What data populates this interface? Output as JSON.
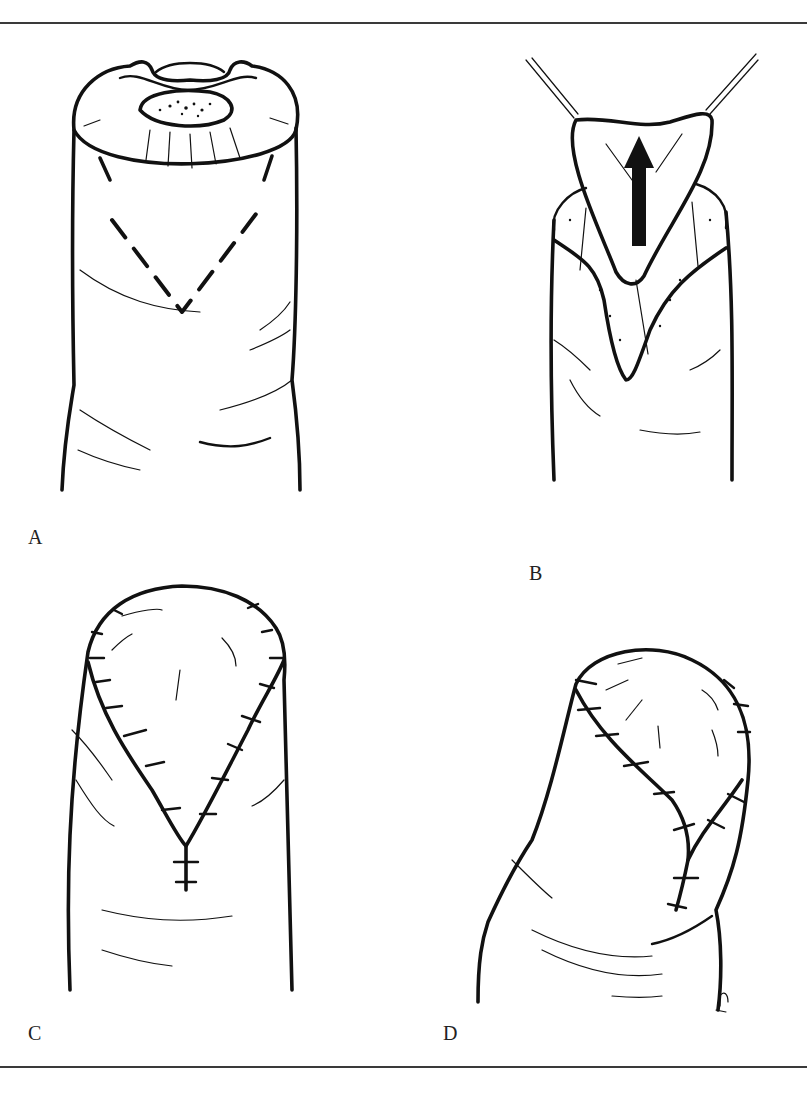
{
  "figure": {
    "panels": [
      {
        "id": "A",
        "label": "A",
        "description": "Fingertip amputation stump with nail bed; dashed V-shaped incision outlined on volar pad"
      },
      {
        "id": "B",
        "label": "B",
        "description": "Triangular flap raised on traction sutures and advanced distally (arrow)"
      },
      {
        "id": "C",
        "label": "C",
        "description": "Flap sutured in place; V converted to Y closure, front view"
      },
      {
        "id": "D",
        "label": "D",
        "description": "Sutured Y closure, oblique view"
      }
    ],
    "annotations": {
      "arrow": "advancement-direction-arrow",
      "signature": "artist-initials"
    },
    "colors": {
      "ink": "#111111",
      "rule": "#3a3a3a",
      "background": "#ffffff"
    }
  }
}
